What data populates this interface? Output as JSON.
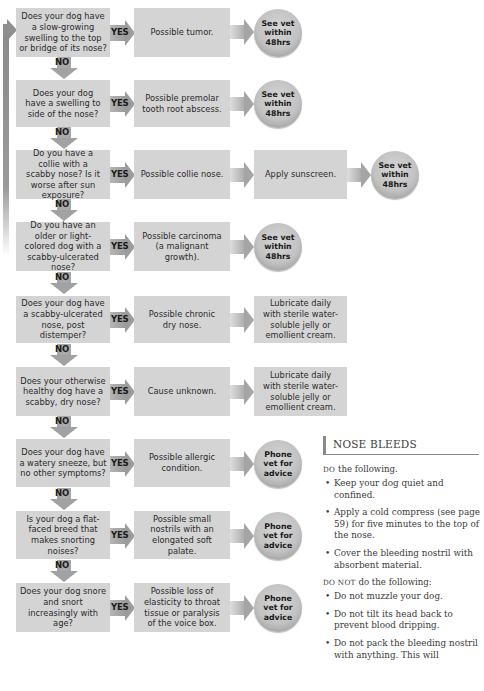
{
  "flowchart": {
    "labels": {
      "yes": "YES",
      "no": "NO"
    },
    "rows": [
      {
        "question": "Does your dog have a slow-growing swelling to the top or bridge of its nose?",
        "result": "Possible tumor.",
        "action": null,
        "advice": "See vet within 48hrs"
      },
      {
        "question": "Does your dog have a swelling to side of the nose?",
        "result": "Possible premolar tooth root abscess.",
        "action": null,
        "advice": "See vet within 48hrs"
      },
      {
        "question": "Do you have a collie with a scabby nose? Is it worse after sun exposure?",
        "result": "Possible collie nose.",
        "action": "Apply sunscreen.",
        "advice": "See vet within 48hrs"
      },
      {
        "question": "Do you have an older or light-colored dog with a scabby-ulcerated nose?",
        "result": "Possible carcinoma (a malignant growth).",
        "action": null,
        "advice": "See vet within 48hrs"
      },
      {
        "question": "Does your dog have a scabby-ulcerated nose, post distemper?",
        "result": "Possible chronic dry nose.",
        "action": "Lubricate daily with sterile water-soluble jelly or emollient cream.",
        "advice": null
      },
      {
        "question": "Does your otherwise healthy dog have a scabby, dry nose?",
        "result": "Cause unknown.",
        "action": "Lubricate daily with sterile water-soluble jelly or emollient cream.",
        "advice": null
      },
      {
        "question": "Does your dog have a watery sneeze, but no other symptoms?",
        "result": "Possible allergic condition.",
        "action": null,
        "advice": "Phone vet for advice"
      },
      {
        "question": "Is your dog a flat-faced breed that makes snorting noises?",
        "result": "Possible small nostrils with an elongated soft palate.",
        "action": null,
        "advice": "Phone vet for advice"
      },
      {
        "question": "Does your dog snore and snort increasingly with age?",
        "result": "Possible loss of elasticity to throat tissue or paralysis of the voice box.",
        "action": null,
        "advice": "Phone vet for advice"
      }
    ]
  },
  "sidebar": {
    "title": "NOSE BLEEDS",
    "do_heading_caps": "DO",
    "do_heading_rest": " the following.",
    "do_items": [
      "Keep your dog quiet and confined.",
      "Apply a cold compress (see page 59) for five minutes to the top of the nose.",
      "Cover the bleeding nostril with absorbent material."
    ],
    "dont_heading_caps": "DO NOT",
    "dont_heading_rest": " do the following:",
    "dont_items": [
      "Do not muzzle your dog.",
      "Do not tilt its head back to prevent blood dripping.",
      "Do not pack the bleeding nostril with anything. This will"
    ]
  }
}
